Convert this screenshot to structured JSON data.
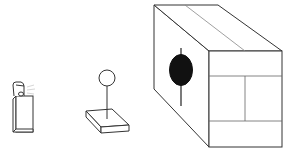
{
  "figure": {
    "width": 301,
    "height": 157,
    "background": "#ffffff",
    "stroke_color": "#333333",
    "fill_dark": "#111111",
    "objects": [
      {
        "id": "small-lighter",
        "description": "small box-shaped object with a hinged lid, emitting faint lines"
      },
      {
        "id": "platform-with-ball",
        "description": "flat slab with a vertical pole topped by a circle"
      },
      {
        "id": "large-box",
        "description": "large rectangular box with a dark oval marking and a vertical line on its side face, front face divided into panels"
      }
    ]
  }
}
